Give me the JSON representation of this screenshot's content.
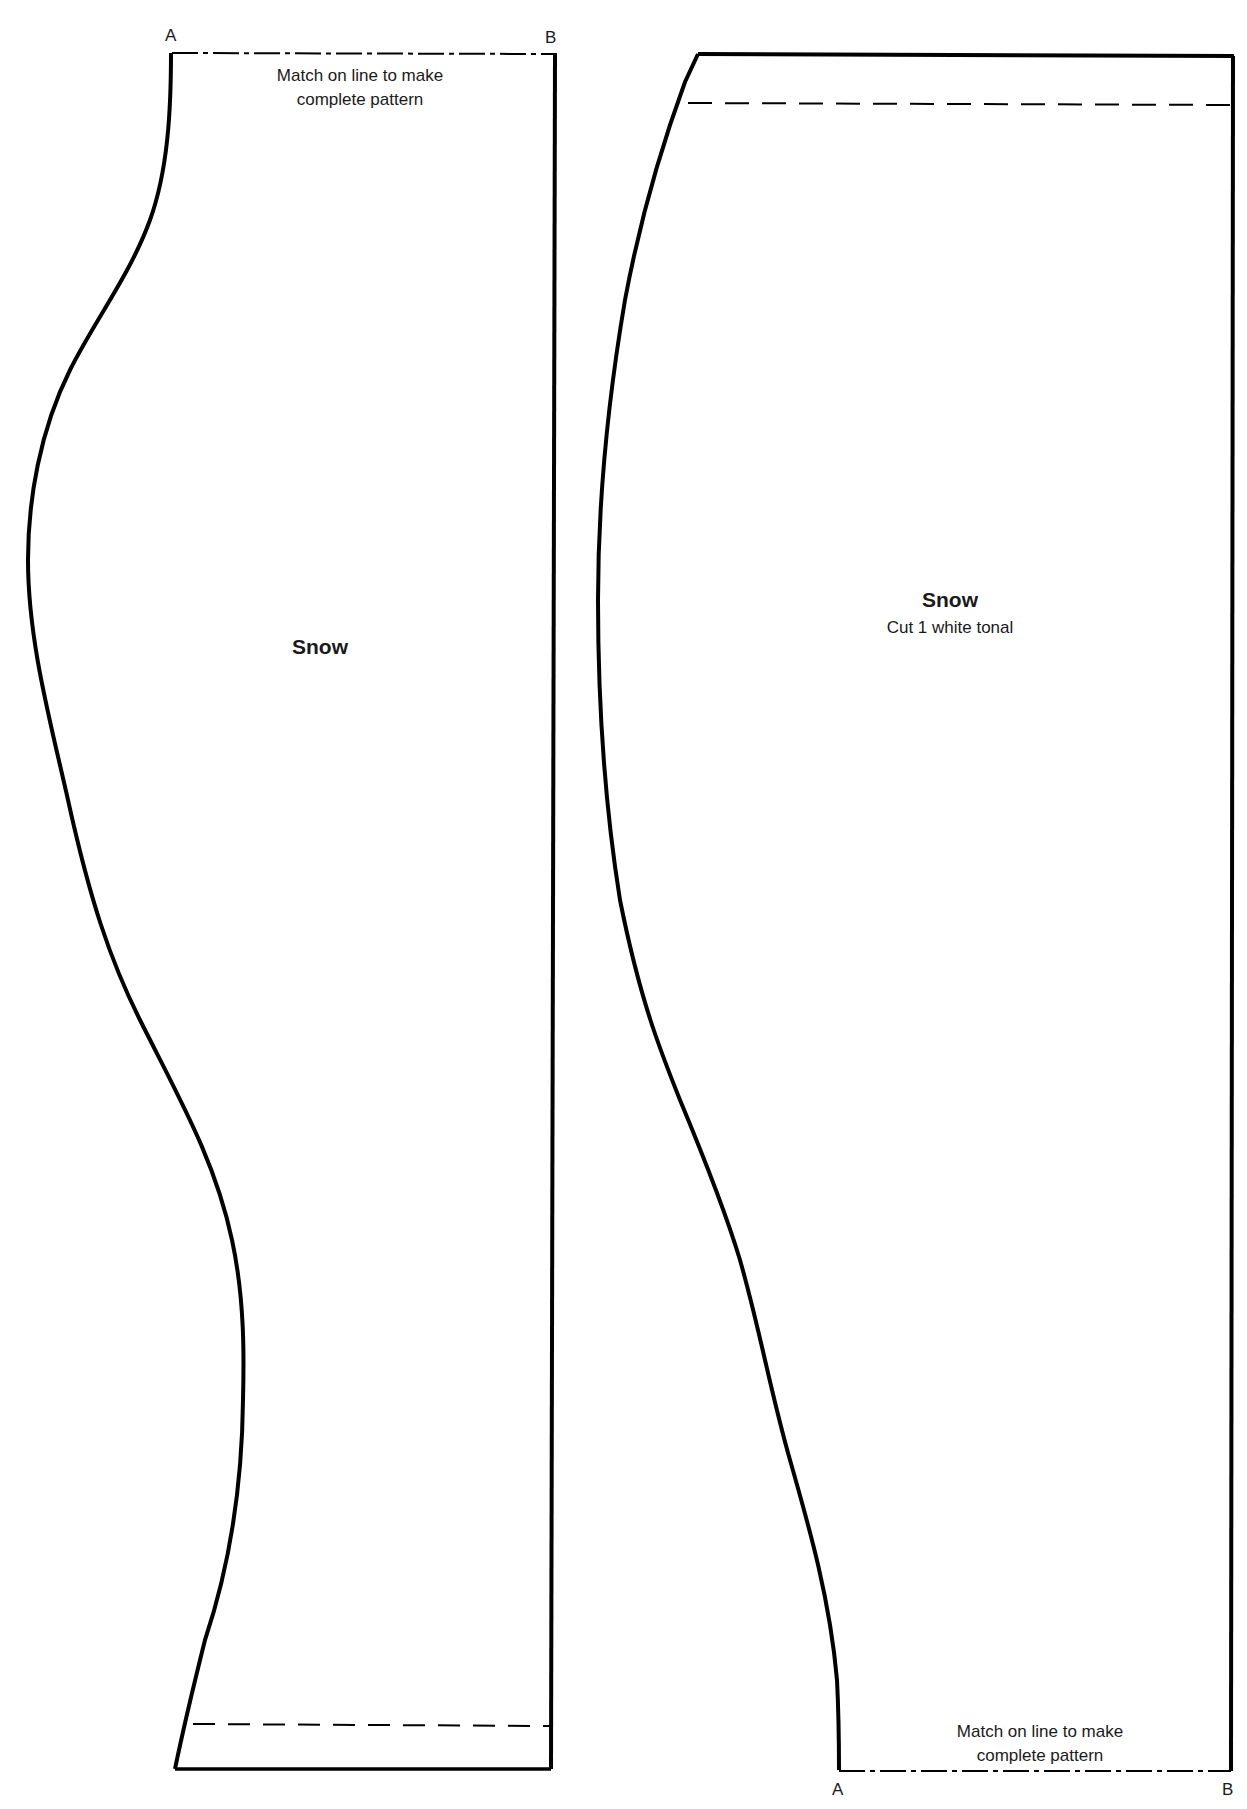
{
  "pieces": [
    {
      "id": "left",
      "name": "Snow",
      "corner_labels": {
        "a": "A",
        "b": "B"
      },
      "match_note": [
        "Match on line to make",
        "complete pattern"
      ],
      "match_line_position": "top",
      "hem_line": "dashed line near bottom"
    },
    {
      "id": "right",
      "name": "Snow",
      "cut_instruction": "Cut 1 white tonal",
      "corner_labels": {
        "a": "A",
        "b": "B"
      },
      "match_note": [
        "Match on line to make",
        "complete pattern"
      ],
      "match_line_position": "bottom",
      "hem_line": "dashed line near top"
    }
  ],
  "colors": {
    "outline": "#000000",
    "background": "#ffffff",
    "text": "#1a1a1a"
  }
}
